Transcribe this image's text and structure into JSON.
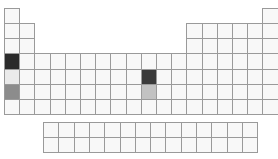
{
  "diagram": {
    "type": "periodic-table-outline",
    "colors": {
      "cell_fill": "#f8f8f8",
      "cell_border": "#9a9a9a",
      "dark": "#2b2b2b",
      "dark2": "#3a3a3a",
      "medium": "#8c8c8c",
      "light": "#c2c2c2",
      "very_light": "#eaeaea"
    },
    "layout": {
      "origin_x": 4,
      "origin_y": 8,
      "cell_w": 15.2,
      "cell_h": 15.15,
      "f_block_origin_x": 43,
      "f_block_origin_y": 122,
      "f_block_cell_w": 15.3
    },
    "main_rows": [
      {
        "period": 1,
        "columns": [
          1,
          18
        ]
      },
      {
        "period": 2,
        "columns": [
          1,
          2,
          13,
          14,
          15,
          16,
          17,
          18
        ]
      },
      {
        "period": 3,
        "columns": [
          1,
          2,
          13,
          14,
          15,
          16,
          17,
          18
        ]
      },
      {
        "period": 4,
        "columns": [
          1,
          2,
          3,
          4,
          5,
          6,
          7,
          8,
          9,
          10,
          11,
          12,
          13,
          14,
          15,
          16,
          17,
          18
        ]
      },
      {
        "period": 5,
        "columns": [
          1,
          2,
          3,
          4,
          5,
          6,
          7,
          8,
          9,
          10,
          11,
          12,
          13,
          14,
          15,
          16,
          17,
          18
        ]
      },
      {
        "period": 6,
        "columns": [
          1,
          2,
          3,
          4,
          5,
          6,
          7,
          8,
          9,
          10,
          11,
          12,
          13,
          14,
          15,
          16,
          17,
          18
        ]
      },
      {
        "period": 7,
        "columns": [
          1,
          2,
          3,
          4,
          5,
          6,
          7,
          8,
          9,
          10,
          11,
          12,
          13,
          14,
          15,
          16,
          17,
          18
        ]
      }
    ],
    "f_block_rows": 2,
    "f_block_columns": 14,
    "highlighted": [
      {
        "period": 4,
        "group": 1,
        "shade": "dark"
      },
      {
        "period": 5,
        "group": 1,
        "shade": "very_light"
      },
      {
        "period": 6,
        "group": 1,
        "shade": "medium"
      },
      {
        "period": 5,
        "group": 10,
        "shade": "dark2"
      },
      {
        "period": 6,
        "group": 10,
        "shade": "light"
      }
    ]
  }
}
